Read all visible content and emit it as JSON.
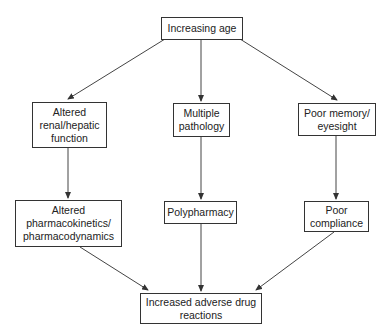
{
  "diagram": {
    "type": "flowchart",
    "nodes": {
      "root": {
        "label": "Increasing age"
      },
      "renal": {
        "label": "Altered\nrenal/hepatic\nfunction"
      },
      "pathology": {
        "label": "Multiple\npathology"
      },
      "memory": {
        "label": "Poor memory/\neyesight"
      },
      "pk": {
        "label": "Altered\npharmacokinetics/\npharmacodynamics"
      },
      "poly": {
        "label": "Polypharmacy"
      },
      "compliance": {
        "label": "Poor\ncompliance"
      },
      "outcome": {
        "label": "Increased adverse drug\nreactions"
      }
    },
    "edges": [
      {
        "from": "Increasing age",
        "to": "Altered renal/hepatic function"
      },
      {
        "from": "Increasing age",
        "to": "Multiple pathology"
      },
      {
        "from": "Increasing age",
        "to": "Poor memory/eyesight"
      },
      {
        "from": "Altered renal/hepatic function",
        "to": "Altered pharmacokinetics/pharmacodynamics"
      },
      {
        "from": "Multiple pathology",
        "to": "Polypharmacy"
      },
      {
        "from": "Poor memory/eyesight",
        "to": "Poor compliance"
      },
      {
        "from": "Altered pharmacokinetics/pharmacodynamics",
        "to": "Increased adverse drug reactions"
      },
      {
        "from": "Polypharmacy",
        "to": "Increased adverse drug reactions"
      },
      {
        "from": "Poor compliance",
        "to": "Increased adverse drug reactions"
      }
    ],
    "colors": {
      "line": "#333333",
      "background": "#ffffff",
      "text": "#222222"
    }
  }
}
